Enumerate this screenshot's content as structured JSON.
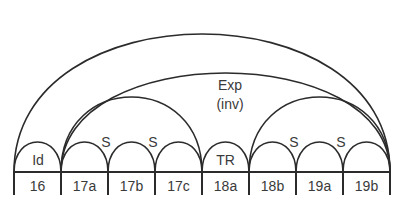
{
  "diagram": {
    "stroke_color": "#2b2b2b",
    "text_color": "#3a3a3a",
    "cells": [
      "16",
      "17a",
      "17b",
      "17c",
      "18a",
      "18b",
      "19a",
      "19b"
    ],
    "arc_labels": {
      "id": "Id",
      "s1": "S",
      "s2": "S",
      "tr": "TR",
      "s3": "S",
      "s4": "S",
      "exp_line1": "Exp",
      "exp_line2": "(inv)"
    },
    "arcs": [
      {
        "name": "outer",
        "from": "16",
        "to": "19b"
      },
      {
        "name": "exp-inv",
        "from": "17a",
        "to": "19b",
        "label": "Exp (inv)"
      },
      {
        "name": "group-17",
        "from": "17a",
        "to": "17c"
      },
      {
        "name": "group-18b-19",
        "from": "18b",
        "to": "19b"
      },
      {
        "name": "cell-16",
        "from": "16",
        "to": "16",
        "label": "Id"
      },
      {
        "name": "cell-17a",
        "from": "17a",
        "to": "17a"
      },
      {
        "name": "cell-17b",
        "from": "17b",
        "to": "17b"
      },
      {
        "name": "cell-17c",
        "from": "17c",
        "to": "17c"
      },
      {
        "name": "cell-18a",
        "from": "18a",
        "to": "18a",
        "label": "TR"
      },
      {
        "name": "cell-18b",
        "from": "18b",
        "to": "18b"
      },
      {
        "name": "cell-19a",
        "from": "19a",
        "to": "19a"
      },
      {
        "name": "cell-19b",
        "from": "19b",
        "to": "19b"
      }
    ]
  }
}
